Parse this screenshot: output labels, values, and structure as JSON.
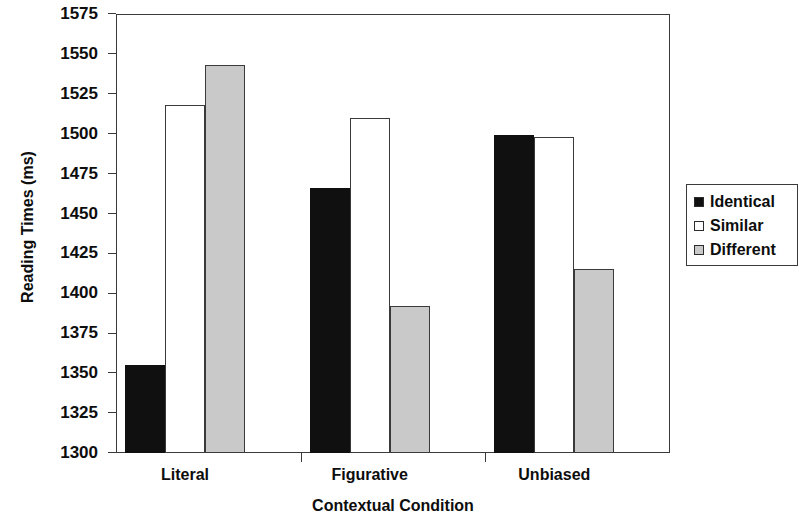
{
  "chart_data": {
    "type": "bar",
    "title": "",
    "xlabel": "Contextual Condition",
    "ylabel": "Reading Times (ms)",
    "categories": [
      "Literal",
      "Figurative",
      "Unbiased"
    ],
    "series": [
      {
        "name": "Identical",
        "color": "#101010",
        "values": [
          1355,
          1466,
          1499
        ]
      },
      {
        "name": "Similar",
        "color": "#ffffff",
        "values": [
          1518,
          1510,
          1498
        ]
      },
      {
        "name": "Different",
        "color": "#c9c9c9",
        "values": [
          1543,
          1392,
          1415
        ]
      }
    ],
    "ylim": [
      1300,
      1575
    ],
    "ytick_step": 25,
    "yticks": [
      1300,
      1325,
      1350,
      1375,
      1400,
      1425,
      1450,
      1475,
      1500,
      1525,
      1550,
      1575
    ],
    "ytick_labels": [
      "1300",
      "1325",
      "1350",
      "1375",
      "1400",
      "1425",
      "1450",
      "1475",
      "1500",
      "1525",
      "1550",
      "1575"
    ],
    "grid": false,
    "legend_position": "right",
    "legend_entries": [
      "Identical",
      "Similar",
      "Different"
    ]
  },
  "axis": {
    "y_title": "Reading Times (ms)",
    "x_title": "Contextual Condition"
  },
  "legend": {
    "items": [
      {
        "label": "Identical",
        "swatch": "filled-black-square-icon"
      },
      {
        "label": "Similar",
        "swatch": "empty-white-square-icon"
      },
      {
        "label": "Different",
        "swatch": "filled-gray-square-icon"
      }
    ]
  }
}
